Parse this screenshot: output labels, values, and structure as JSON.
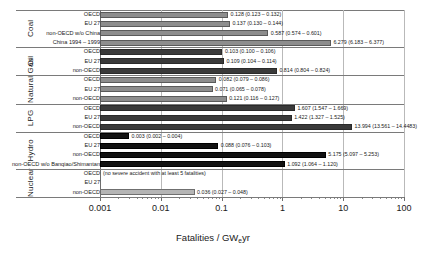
{
  "axis": {
    "title_main": "Fatalities / GW",
    "title_sub": "e",
    "title_tail": "yr",
    "ticks": [
      "0.001",
      "0.01",
      "0.1",
      "1",
      "10",
      "100"
    ],
    "min": 0.001,
    "max": 100,
    "scale": "log"
  },
  "groups": [
    {
      "name": "Coal",
      "rows": [
        {
          "label": "OECD",
          "value": 0.128,
          "low": 0.123,
          "high": 0.132,
          "text": "0.128 (0.123 – 0.132)",
          "shade": "gray"
        },
        {
          "label": "EU 27",
          "value": 0.137,
          "low": 0.13,
          "high": 0.144,
          "text": "0.137 (0.130 – 0.144)",
          "shade": "gray"
        },
        {
          "label": "non-OECD w/o China",
          "value": 0.587,
          "low": 0.574,
          "high": 0.601,
          "text": "0.587 (0.574 – 0.601)",
          "shade": "gray"
        },
        {
          "label": "China 1994 – 1999",
          "value": 6.279,
          "low": 6.183,
          "high": 6.377,
          "text": "6.279 (6.183 – 6.377)",
          "shade": "gray"
        }
      ]
    },
    {
      "name": "Oil",
      "rows": [
        {
          "label": "OECD",
          "value": 0.103,
          "low": 0.1,
          "high": 0.106,
          "text": "0.103 (0.100 – 0.106)",
          "shade": "dark"
        },
        {
          "label": "EU 27",
          "value": 0.109,
          "low": 0.104,
          "high": 0.114,
          "text": "0.109 (0.104 – 0.114)",
          "shade": "dark"
        },
        {
          "label": "non-OECD",
          "value": 0.814,
          "low": 0.804,
          "high": 0.824,
          "text": "0.814 (0.804 – 0.824)",
          "shade": "dark"
        }
      ]
    },
    {
      "name": "Natural Gas",
      "rows": [
        {
          "label": "OECD",
          "value": 0.082,
          "low": 0.079,
          "high": 0.086,
          "text": "0.082 (0.079 – 0.086)",
          "shade": "gray"
        },
        {
          "label": "EU 27",
          "value": 0.071,
          "low": 0.065,
          "high": 0.078,
          "text": "0.071 (0.065 – 0.078)",
          "shade": "gray"
        },
        {
          "label": "non-OECD",
          "value": 0.121,
          "low": 0.116,
          "high": 0.127,
          "text": "0.121 (0.116 – 0.127)",
          "shade": "gray"
        }
      ]
    },
    {
      "name": "LPG",
      "rows": [
        {
          "label": "OECD",
          "value": 1.607,
          "low": 1.547,
          "high": 1.669,
          "text": "1.607 (1.547 – 1.669)",
          "shade": "dark"
        },
        {
          "label": "EU 27",
          "value": 1.422,
          "low": 1.327,
          "high": 1.525,
          "text": "1.422 (1.327 – 1.525)",
          "shade": "dark"
        },
        {
          "label": "non-OECD",
          "value": 13.994,
          "low": 13.561,
          "high": 14.4483,
          "text": "13.994 (13.561 – 14.4483)",
          "shade": "dark"
        }
      ]
    },
    {
      "name": "Hydro",
      "rows": [
        {
          "label": "OECD",
          "value": 0.003,
          "low": 0.002,
          "high": 0.004,
          "text": "0.003 (0.002 – 0.004)",
          "shade": "black"
        },
        {
          "label": "EU 27",
          "value": 0.088,
          "low": 0.076,
          "high": 0.103,
          "text": "0.088 (0.076 – 0.103)",
          "shade": "black"
        },
        {
          "label": "non-OECD",
          "value": 5.175,
          "low": 5.097,
          "high": 5.253,
          "text": "5.175 (5.097 – 5.253)",
          "shade": "black"
        },
        {
          "label": "non-OECD w/o Banqiao/Shimantan",
          "value": 1.092,
          "low": 1.064,
          "high": 1.12,
          "text": "1.092 (1.064 – 1.120)",
          "shade": "black"
        }
      ]
    },
    {
      "name": "Nuclear",
      "rows": [
        {
          "label": "OECD",
          "value": 0,
          "text": "",
          "shade": "none",
          "note": "(no severe accident with at least 5 fatalities)"
        },
        {
          "label": "EU 27",
          "value": 0,
          "text": "",
          "shade": "none"
        },
        {
          "label": "non-OECD",
          "value": 0.036,
          "low": 0.027,
          "high": 0.048,
          "text": "0.036 (0.027 – 0.048)",
          "shade": "light"
        }
      ]
    }
  ],
  "chart_data": {
    "type": "bar",
    "orientation": "horizontal",
    "title": "",
    "xlabel": "Fatalities / GWeyr",
    "ylabel": "",
    "xscale": "log",
    "xlim": [
      0.001,
      100
    ],
    "xticks": [
      0.001,
      0.01,
      0.1,
      1,
      10,
      100
    ],
    "xticklabels": [
      "0.001",
      "0.01",
      "0.1",
      "1",
      "10",
      "100"
    ],
    "grid": true,
    "legend": "none",
    "categories": [
      "Coal — OECD",
      "Coal — EU 27",
      "Coal — non-OECD w/o China",
      "Coal — China 1994 – 1999",
      "Oil — OECD",
      "Oil — EU 27",
      "Oil — non-OECD",
      "Natural Gas — OECD",
      "Natural Gas — EU 27",
      "Natural Gas — non-OECD",
      "LPG — OECD",
      "LPG — EU 27",
      "LPG — non-OECD",
      "Hydro — OECD",
      "Hydro — EU 27",
      "Hydro — non-OECD",
      "Hydro — non-OECD w/o Banqiao/Shimantan",
      "Nuclear — OECD",
      "Nuclear — EU 27",
      "Nuclear — non-OECD"
    ],
    "values": [
      0.128,
      0.137,
      0.587,
      6.279,
      0.103,
      0.109,
      0.814,
      0.082,
      0.071,
      0.121,
      1.607,
      1.422,
      13.994,
      0.003,
      0.088,
      5.175,
      1.092,
      0,
      0,
      0.036
    ],
    "errors_low": [
      0.123,
      0.13,
      0.574,
      6.183,
      0.1,
      0.104,
      0.804,
      0.079,
      0.065,
      0.116,
      1.547,
      1.327,
      13.561,
      0.002,
      0.076,
      5.097,
      1.064,
      null,
      null,
      0.027
    ],
    "errors_high": [
      0.132,
      0.144,
      0.601,
      6.377,
      0.106,
      0.114,
      0.824,
      0.086,
      0.078,
      0.127,
      1.669,
      1.525,
      14.4483,
      0.004,
      0.103,
      5.253,
      1.12,
      null,
      null,
      0.048
    ],
    "annotations": [
      {
        "category": "Nuclear — OECD",
        "text": "(no severe accident with at least 5 fatalities)"
      }
    ]
  }
}
